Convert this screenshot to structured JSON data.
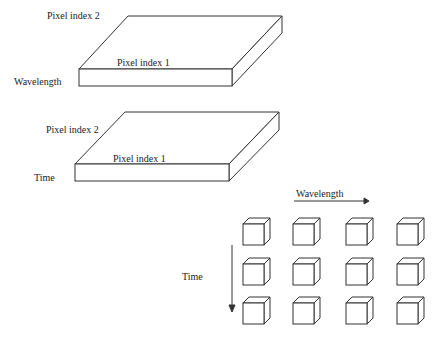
{
  "slab_top": {
    "axis_depth": "Pixel index 2",
    "axis_width": "Pixel index 1",
    "axis_thickness": "Wavelength"
  },
  "slab_bottom": {
    "axis_depth": "Pixel index 2",
    "axis_width": "Pixel index 1",
    "axis_thickness": "Time"
  },
  "grid": {
    "horizontal_axis": "Wavelength",
    "vertical_axis": "Time",
    "rows": 3,
    "columns": 4
  }
}
